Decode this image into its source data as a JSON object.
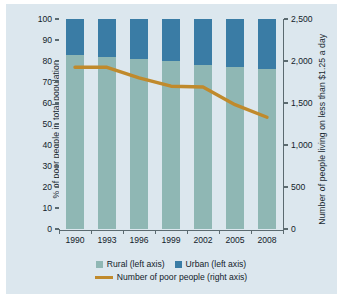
{
  "chart_data": {
    "type": "bar",
    "title": "",
    "subtitle": "",
    "xlabel": "",
    "categories": [
      "1990",
      "1993",
      "1996",
      "1999",
      "2002",
      "2005",
      "2008"
    ],
    "series": [
      {
        "name": "Rural (left axis)",
        "axis": "left",
        "color": "#8fb7b4",
        "values": [
          83,
          82,
          81,
          80,
          78,
          77,
          76
        ]
      },
      {
        "name": "Urban (left axis)",
        "axis": "left",
        "color": "#3a7ca5",
        "values": [
          17,
          18,
          19,
          20,
          22,
          23,
          24
        ]
      },
      {
        "name": "Number of poor people (right axis)",
        "axis": "right",
        "type": "line",
        "color": "#c08a2c",
        "values": [
          1925,
          1925,
          1800,
          1700,
          1690,
          1480,
          1330
        ]
      }
    ],
    "left_axis": {
      "label": "% of poor people in total population",
      "ticks": [
        "0",
        "10",
        "20",
        "30",
        "40",
        "50",
        "60",
        "70",
        "80",
        "90",
        "100"
      ],
      "values": [
        0,
        10,
        20,
        30,
        40,
        50,
        60,
        70,
        80,
        90,
        100
      ],
      "ylim": [
        0,
        100
      ]
    },
    "right_axis": {
      "label": "Number of people living on less than $1.25 a day",
      "ticks": [
        "0",
        "500",
        "1,000",
        "1,500",
        "2,000",
        "2,500"
      ],
      "values": [
        0,
        500,
        1000,
        1500,
        2000,
        2500
      ],
      "ylim": [
        0,
        2500
      ]
    },
    "legend": {
      "position": "bottom",
      "entries": [
        {
          "label": "Rural (left axis)",
          "color": "#8fb7b4",
          "marker": "square"
        },
        {
          "label": "Urban (left axis)",
          "color": "#3a7ca5",
          "marker": "square"
        },
        {
          "label": "Number of poor people (right axis)",
          "color": "#c08a2c",
          "marker": "line"
        }
      ]
    },
    "grid": false,
    "background_color": "#dce7ee"
  }
}
